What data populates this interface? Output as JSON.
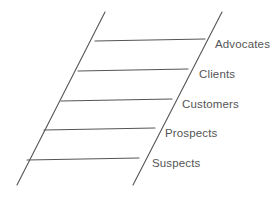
{
  "diagram": {
    "type": "ladder-diagram",
    "colors": {
      "background": "#ffffff",
      "line": "#555555",
      "text": "#555555"
    },
    "rails": {
      "left": {
        "x1": 105,
        "y1": 12,
        "x2": 17,
        "y2": 185
      },
      "right": {
        "x1": 222,
        "y1": 12,
        "x2": 133,
        "y2": 185
      }
    },
    "rungs": [
      {
        "label": "Advocates",
        "level": 5,
        "x1": 95,
        "y1": 41,
        "x2": 205,
        "y2": 39,
        "label_x": 215,
        "label_y": 39
      },
      {
        "label": "Clients",
        "level": 4,
        "x1": 78,
        "y1": 71,
        "x2": 188,
        "y2": 69,
        "label_x": 199,
        "label_y": 69
      },
      {
        "label": "Customers",
        "level": 3,
        "x1": 61,
        "y1": 101,
        "x2": 172,
        "y2": 99,
        "label_x": 182,
        "label_y": 99
      },
      {
        "label": "Prospects",
        "level": 2,
        "x1": 44,
        "y1": 130,
        "x2": 155,
        "y2": 128,
        "label_x": 165,
        "label_y": 128
      },
      {
        "label": "Suspects",
        "level": 1,
        "x1": 27,
        "y1": 160,
        "x2": 139,
        "y2": 158,
        "label_x": 152,
        "label_y": 158
      }
    ]
  }
}
